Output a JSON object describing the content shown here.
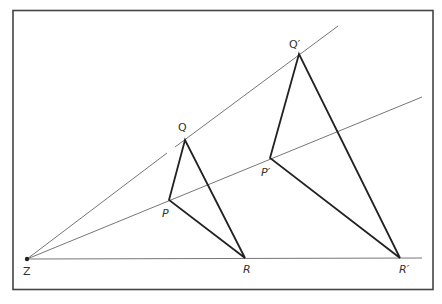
{
  "figure": {
    "colors": {
      "line": "#555555",
      "triangle": "#222222",
      "frame": "#444444",
      "label": "#333333"
    },
    "frame": {
      "x1": 13,
      "y1": 10,
      "x2": 433,
      "y2": 290
    },
    "centre": {
      "label": "Z",
      "x": 27,
      "y": 259
    },
    "points": {
      "P": {
        "label": "P",
        "x": 169,
        "y": 200
      },
      "Q": {
        "label": "Q",
        "x": 185,
        "y": 140
      },
      "R": {
        "label": "R",
        "x": 245,
        "y": 258
      },
      "P_prime": {
        "label": "P′",
        "x": 270,
        "y": 158
      },
      "Q_prime": {
        "label": "Q′",
        "x": 299,
        "y": 54
      },
      "R_prime": {
        "label": "R′",
        "x": 400,
        "y": 258
      }
    },
    "rays": [
      {
        "name": "ray-through-Q",
        "x2": 338,
        "y2": 26
      },
      {
        "name": "ray-through-P",
        "x2": 422,
        "y2": 97
      },
      {
        "name": "ray-through-R",
        "x2": 422,
        "y2": 258
      }
    ]
  }
}
